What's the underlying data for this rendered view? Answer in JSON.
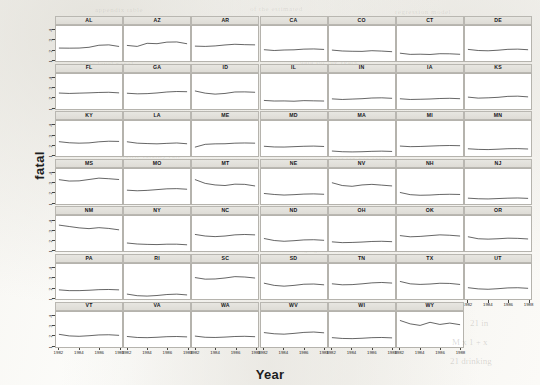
{
  "figure": {
    "ylabel": "fatal",
    "xlabel": "Year",
    "ytick_labels": [
      "1",
      "2",
      "3",
      "4"
    ],
    "xtick_labels": [
      "1982",
      "1984",
      "1986",
      "1988"
    ],
    "background_note": "scanned page, faint show-through text"
  },
  "ghost_text": [
    {
      "t": "appendix table",
      "x": 95,
      "y": 6
    },
    {
      "t": "of the estimated",
      "x": 250,
      "y": 5
    },
    {
      "t": "regression model",
      "x": 395,
      "y": 8
    },
    {
      "t": "state level panel",
      "x": 80,
      "y": 60
    },
    {
      "t": "data for the years",
      "x": 300,
      "y": 58
    },
    {
      "t": "traffic fatality rate",
      "x": 120,
      "y": 152
    },
    {
      "t": "beer tax per case",
      "x": 330,
      "y": 155
    },
    {
      "t": "unemployment",
      "x": 70,
      "y": 244
    },
    {
      "t": "drinking age laws",
      "x": 280,
      "y": 246
    },
    {
      "t": "per capita income",
      "x": 150,
      "y": 300
    },
    {
      "t": "minimum legal",
      "x": 400,
      "y": 302
    }
  ],
  "smudges": [
    {
      "t": "21 in",
      "x": 470,
      "y": 318
    },
    {
      "t": "M x 1 + x",
      "x": 452,
      "y": 337
    },
    {
      "t": "21 drinking",
      "x": 450,
      "y": 356
    }
  ],
  "chart_data": {
    "type": "line",
    "title": "",
    "xlabel": "Year",
    "ylabel": "fatal",
    "xlim": [
      1982,
      1988
    ],
    "ylim": [
      0.8,
      4.4
    ],
    "x": [
      1982,
      1983,
      1984,
      1985,
      1986,
      1987,
      1988
    ],
    "grid": false,
    "legend": null,
    "layout": {
      "rows": 7,
      "cols": 7,
      "panels": 48,
      "strip_labels_on_top": true
    },
    "series": [
      {
        "name": "AL",
        "row": 1,
        "col": 1,
        "values": [
          2.13,
          2.12,
          2.13,
          2.21,
          2.42,
          2.46,
          2.3
        ]
      },
      {
        "name": "AZ",
        "row": 1,
        "col": 2,
        "values": [
          2.4,
          2.3,
          2.62,
          2.58,
          2.74,
          2.76,
          2.58
        ]
      },
      {
        "name": "AR",
        "row": 1,
        "col": 3,
        "values": [
          2.33,
          2.3,
          2.35,
          2.45,
          2.52,
          2.48,
          2.46
        ]
      },
      {
        "name": "CA",
        "row": 1,
        "col": 4,
        "values": [
          1.96,
          1.88,
          1.93,
          1.95,
          2.02,
          2.04,
          1.99
        ]
      },
      {
        "name": "CO",
        "row": 1,
        "col": 5,
        "values": [
          1.92,
          1.83,
          1.8,
          1.79,
          1.86,
          1.82,
          1.76
        ]
      },
      {
        "name": "CT",
        "row": 1,
        "col": 6,
        "values": [
          1.6,
          1.48,
          1.5,
          1.47,
          1.55,
          1.54,
          1.49
        ]
      },
      {
        "name": "DE",
        "row": 1,
        "col": 7,
        "values": [
          1.99,
          1.88,
          1.85,
          1.91,
          2.0,
          2.02,
          1.96
        ]
      },
      {
        "name": "FL",
        "row": 2,
        "col": 1,
        "values": [
          2.44,
          2.4,
          2.43,
          2.46,
          2.5,
          2.52,
          2.46
        ]
      },
      {
        "name": "GA",
        "row": 2,
        "col": 2,
        "values": [
          2.42,
          2.36,
          2.38,
          2.45,
          2.55,
          2.6,
          2.58
        ]
      },
      {
        "name": "ID",
        "row": 2,
        "col": 3,
        "values": [
          2.65,
          2.43,
          2.33,
          2.4,
          2.55,
          2.56,
          2.52
        ]
      },
      {
        "name": "IL",
        "row": 2,
        "col": 4,
        "values": [
          1.68,
          1.62,
          1.63,
          1.6,
          1.66,
          1.64,
          1.62
        ]
      },
      {
        "name": "IN",
        "row": 2,
        "col": 5,
        "values": [
          1.84,
          1.78,
          1.82,
          1.86,
          1.93,
          1.95,
          1.9
        ]
      },
      {
        "name": "IA",
        "row": 2,
        "col": 6,
        "values": [
          1.85,
          1.78,
          1.8,
          1.83,
          1.88,
          1.9,
          1.86
        ]
      },
      {
        "name": "KS",
        "row": 2,
        "col": 7,
        "values": [
          2.02,
          1.92,
          1.95,
          2.0,
          2.1,
          2.12,
          2.05
        ]
      },
      {
        "name": "KY",
        "row": 3,
        "col": 1,
        "values": [
          2.27,
          2.16,
          2.12,
          2.15,
          2.26,
          2.32,
          2.3
        ]
      },
      {
        "name": "LA",
        "row": 3,
        "col": 2,
        "values": [
          2.26,
          2.12,
          2.08,
          2.05,
          2.1,
          2.14,
          2.06
        ]
      },
      {
        "name": "ME",
        "row": 3,
        "col": 3,
        "values": [
          1.72,
          2.0,
          2.05,
          2.06,
          2.12,
          2.14,
          2.12
        ]
      },
      {
        "name": "MD",
        "row": 3,
        "col": 4,
        "values": [
          1.8,
          1.73,
          1.72,
          1.76,
          1.8,
          1.82,
          1.78
        ]
      },
      {
        "name": "MA",
        "row": 3,
        "col": 5,
        "values": [
          1.31,
          1.24,
          1.22,
          1.24,
          1.28,
          1.3,
          1.27
        ]
      },
      {
        "name": "MI",
        "row": 3,
        "col": 6,
        "values": [
          1.82,
          1.76,
          1.78,
          1.82,
          1.86,
          1.88,
          1.86
        ]
      },
      {
        "name": "MN",
        "row": 3,
        "col": 7,
        "values": [
          1.54,
          1.48,
          1.46,
          1.5,
          1.55,
          1.56,
          1.52
        ]
      },
      {
        "name": "MS",
        "row": 4,
        "col": 1,
        "values": [
          3.3,
          3.16,
          3.18,
          3.32,
          3.46,
          3.4,
          3.32
        ]
      },
      {
        "name": "MO",
        "row": 4,
        "col": 2,
        "values": [
          2.22,
          2.16,
          2.2,
          2.28,
          2.36,
          2.38,
          2.32
        ]
      },
      {
        "name": "MT",
        "row": 4,
        "col": 3,
        "values": [
          3.3,
          2.92,
          2.76,
          2.7,
          2.84,
          2.82,
          2.66
        ]
      },
      {
        "name": "NE",
        "row": 4,
        "col": 4,
        "values": [
          1.88,
          1.78,
          1.72,
          1.76,
          1.82,
          1.84,
          1.8
        ]
      },
      {
        "name": "NV",
        "row": 4,
        "col": 5,
        "values": [
          2.98,
          2.7,
          2.62,
          2.76,
          2.82,
          2.74,
          2.66
        ]
      },
      {
        "name": "NH",
        "row": 4,
        "col": 6,
        "values": [
          1.98,
          1.76,
          1.7,
          1.72,
          1.78,
          1.8,
          1.78
        ]
      },
      {
        "name": "NJ",
        "row": 4,
        "col": 7,
        "values": [
          1.4,
          1.34,
          1.32,
          1.36,
          1.4,
          1.42,
          1.38
        ]
      },
      {
        "name": "NM",
        "row": 5,
        "col": 1,
        "values": [
          3.46,
          3.32,
          3.18,
          3.1,
          3.2,
          3.12,
          2.98
        ]
      },
      {
        "name": "NY",
        "row": 5,
        "col": 2,
        "values": [
          1.62,
          1.52,
          1.48,
          1.46,
          1.5,
          1.5,
          1.44
        ]
      },
      {
        "name": "NC",
        "row": 5,
        "col": 3,
        "values": [
          2.5,
          2.34,
          2.28,
          2.34,
          2.46,
          2.5,
          2.46
        ]
      },
      {
        "name": "ND",
        "row": 5,
        "col": 4,
        "values": [
          2.08,
          1.88,
          1.8,
          1.86,
          1.94,
          1.96,
          1.9
        ]
      },
      {
        "name": "OH",
        "row": 5,
        "col": 5,
        "values": [
          1.74,
          1.66,
          1.68,
          1.72,
          1.78,
          1.8,
          1.76
        ]
      },
      {
        "name": "OK",
        "row": 5,
        "col": 6,
        "values": [
          2.38,
          2.26,
          2.3,
          2.38,
          2.46,
          2.42,
          2.34
        ]
      },
      {
        "name": "OR",
        "row": 5,
        "col": 7,
        "values": [
          2.26,
          2.06,
          2.02,
          2.06,
          2.12,
          2.1,
          2.04
        ]
      },
      {
        "name": "PA",
        "row": 6,
        "col": 1,
        "values": [
          1.74,
          1.66,
          1.66,
          1.7,
          1.76,
          1.78,
          1.74
        ]
      },
      {
        "name": "RI",
        "row": 6,
        "col": 2,
        "values": [
          1.3,
          1.14,
          1.1,
          1.16,
          1.26,
          1.3,
          1.22
        ]
      },
      {
        "name": "SC",
        "row": 6,
        "col": 3,
        "values": [
          3.0,
          2.84,
          2.86,
          2.96,
          3.1,
          3.06,
          2.96
        ]
      },
      {
        "name": "SD",
        "row": 6,
        "col": 4,
        "values": [
          2.42,
          2.2,
          2.12,
          2.2,
          2.32,
          2.34,
          2.26
        ]
      },
      {
        "name": "TN",
        "row": 6,
        "col": 5,
        "values": [
          2.36,
          2.26,
          2.28,
          2.36,
          2.46,
          2.5,
          2.44
        ]
      },
      {
        "name": "TX",
        "row": 6,
        "col": 6,
        "values": [
          2.6,
          2.36,
          2.3,
          2.34,
          2.42,
          2.4,
          2.3
        ]
      },
      {
        "name": "UT",
        "row": 6,
        "col": 7,
        "values": [
          1.96,
          1.84,
          1.8,
          1.86,
          1.94,
          1.96,
          1.9
        ]
      },
      {
        "name": "VT",
        "row": 7,
        "col": 1,
        "values": [
          2.1,
          1.94,
          1.9,
          1.96,
          2.04,
          2.06,
          2.0
        ]
      },
      {
        "name": "VA",
        "row": 7,
        "col": 2,
        "values": [
          1.88,
          1.78,
          1.76,
          1.8,
          1.86,
          1.88,
          1.84
        ]
      },
      {
        "name": "WA",
        "row": 7,
        "col": 3,
        "values": [
          1.92,
          1.8,
          1.78,
          1.82,
          1.88,
          1.9,
          1.86
        ]
      },
      {
        "name": "WV",
        "row": 7,
        "col": 4,
        "values": [
          2.28,
          2.16,
          2.12,
          2.2,
          2.3,
          2.34,
          2.26
        ]
      },
      {
        "name": "WI",
        "row": 7,
        "col": 5,
        "values": [
          1.76,
          1.68,
          1.66,
          1.7,
          1.76,
          1.78,
          1.74
        ]
      },
      {
        "name": "WY",
        "row": 7,
        "col": 6,
        "values": [
          3.52,
          3.18,
          3.02,
          3.34,
          3.12,
          3.26,
          3.1
        ]
      }
    ]
  }
}
